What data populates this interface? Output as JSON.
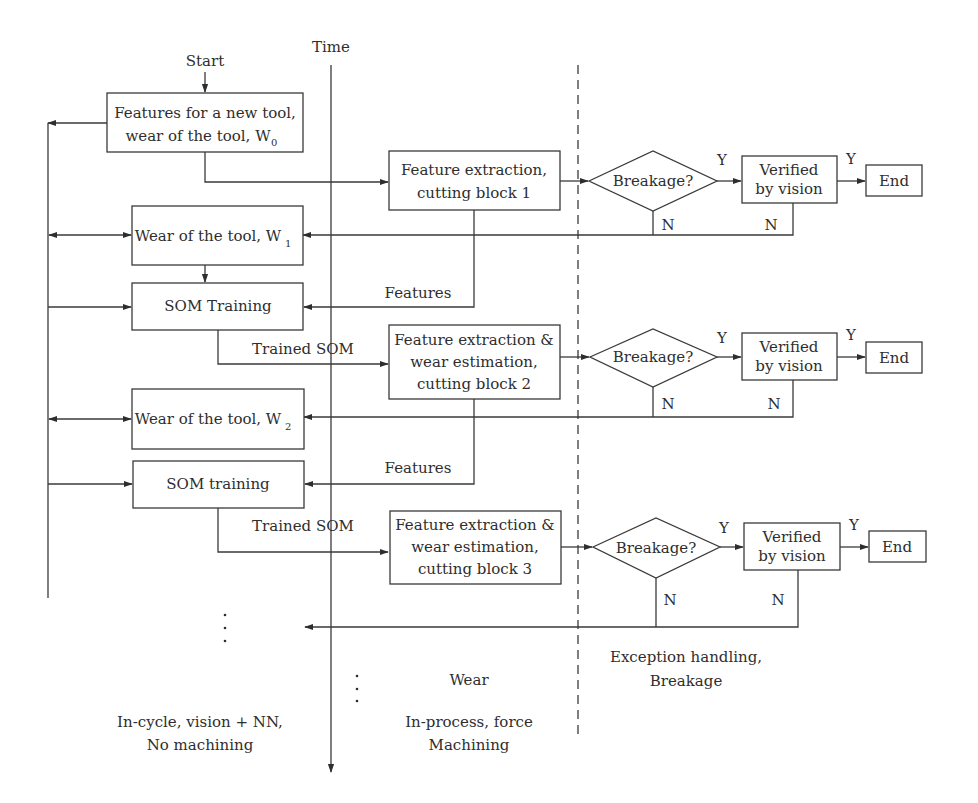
{
  "diagram": {
    "start_label": "Start",
    "time_axis_label": "Time",
    "init_box": {
      "line1": "Features for a new tool,",
      "line2": "wear of the tool, W",
      "subscript": "0"
    },
    "stages": [
      {
        "process": {
          "line1": "Feature extraction,",
          "line2": "cutting block 1",
          "line3": ""
        },
        "decision": "Breakage?",
        "verify": {
          "line1": "Verified",
          "line2": "by vision"
        },
        "end": "End",
        "yes": "Y",
        "no": "N"
      },
      {
        "process": {
          "line1": "Feature extraction &",
          "line2": "wear estimation,",
          "line3": "cutting block 2"
        },
        "decision": "Breakage?",
        "verify": {
          "line1": "Verified",
          "line2": "by vision"
        },
        "end": "End",
        "yes": "Y",
        "no": "N"
      },
      {
        "process": {
          "line1": "Feature extraction &",
          "line2": "wear estimation,",
          "line3": "cutting block 3"
        },
        "decision": "Breakage?",
        "verify": {
          "line1": "Verified",
          "line2": "by vision"
        },
        "end": "End",
        "yes": "Y",
        "no": "N"
      }
    ],
    "wear_boxes": [
      {
        "label": "Wear of the tool, W",
        "subscript": "1"
      },
      {
        "label": "Wear of the tool, W",
        "subscript": "2"
      }
    ],
    "som_boxes": [
      "SOM Training",
      "SOM training"
    ],
    "edge_labels": {
      "features_1": "Features",
      "features_2": "Features",
      "trained_som_1": "Trained SOM",
      "trained_som_2": "Trained SOM"
    },
    "continuation": "⋮",
    "regions": {
      "left": {
        "line1": "In-cycle, vision + NN,",
        "line2": "No machining"
      },
      "middle_top": "Wear",
      "middle": {
        "line1": "In-process, force",
        "line2": "Machining"
      },
      "right": {
        "line1": "Exception handling,",
        "line2": "Breakage"
      }
    }
  }
}
